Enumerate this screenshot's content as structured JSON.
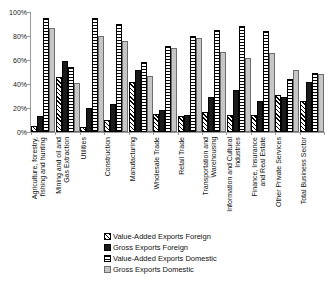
{
  "chart_data": {
    "type": "bar",
    "title": "",
    "xlabel": "",
    "ylabel": "",
    "ylim": [
      0,
      100
    ],
    "y_unit": "%",
    "grid": false,
    "legend_position": "bottom",
    "y_ticks": [
      "0%",
      "20%",
      "40%",
      "60%",
      "80%",
      "100%"
    ],
    "y_tick_values": [
      0,
      20,
      40,
      60,
      80,
      100
    ],
    "categories": [
      "Agriculture, forestry,\nfishing and hunting",
      "Mining and oil and\nGas Extraction",
      "Utilities",
      "Construction",
      "Manufacturing",
      "Wholesale Trade",
      "Retail Trade",
      "Transportation and\nWarehousing",
      "Information and Cultural\nIndustries",
      "Finance, Insurance\nand Real Estate",
      "Other Private Services",
      "Total Business Sector"
    ],
    "series": [
      {
        "name": "Value-Added Exports Foreign",
        "pattern": "diagonal-hatch",
        "values": [
          5,
          46,
          4,
          10,
          42,
          15,
          13,
          17,
          14,
          14,
          31,
          26
        ]
      },
      {
        "name": "Gross Exports Foreign",
        "pattern": "solid-black",
        "values": [
          13,
          59,
          20,
          23,
          52,
          18,
          14,
          29,
          35,
          26,
          29,
          42
        ]
      },
      {
        "name": "Value-Added Exports Domestic",
        "pattern": "horizontal-stripe",
        "values": [
          95,
          54,
          95,
          90,
          58,
          72,
          80,
          85,
          88,
          84,
          44,
          49
        ]
      },
      {
        "name": "Gross Exports Domestic",
        "pattern": "light-gray",
        "values": [
          87,
          41,
          80,
          76,
          47,
          70,
          78,
          67,
          62,
          66,
          52,
          48
        ]
      }
    ]
  },
  "legend": {
    "items": [
      {
        "label": "Value-Added Exports Foreign",
        "pattern": "diagonal-hatch"
      },
      {
        "label": "Gross Exports Foreign",
        "pattern": "solid-black"
      },
      {
        "label": "Value-Added Exports Domestic",
        "pattern": "horizontal-stripe"
      },
      {
        "label": "Gross Exports Domestic",
        "pattern": "light-gray"
      }
    ]
  }
}
